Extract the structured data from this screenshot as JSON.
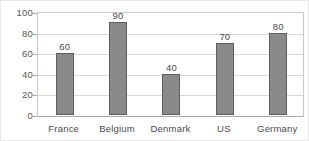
{
  "chart_data": {
    "type": "bar",
    "title": "",
    "xlabel": "",
    "ylabel": "",
    "categories": [
      "France",
      "Belgium",
      "Denmark",
      "US",
      "Germany"
    ],
    "values": [
      60,
      90,
      40,
      70,
      80
    ],
    "value_labels": [
      "60",
      "90",
      "40",
      "70",
      "80"
    ],
    "ylim": [
      0,
      100
    ],
    "yticks": [
      100,
      80,
      60,
      40,
      20,
      0
    ],
    "ytick_labels": [
      "100",
      "80",
      "60",
      "40",
      "20",
      "0"
    ],
    "grid": true,
    "legend": null,
    "colors": {
      "bar_fill": "#8a8a8a",
      "bar_border": "#5e5e5e",
      "gridline": "#d7d7d7",
      "axis": "#a9a9a9",
      "frame": "#c9c9c9",
      "label_text": "#4a4a4a",
      "tick_text": "#555555",
      "background": "#ffffff"
    }
  }
}
